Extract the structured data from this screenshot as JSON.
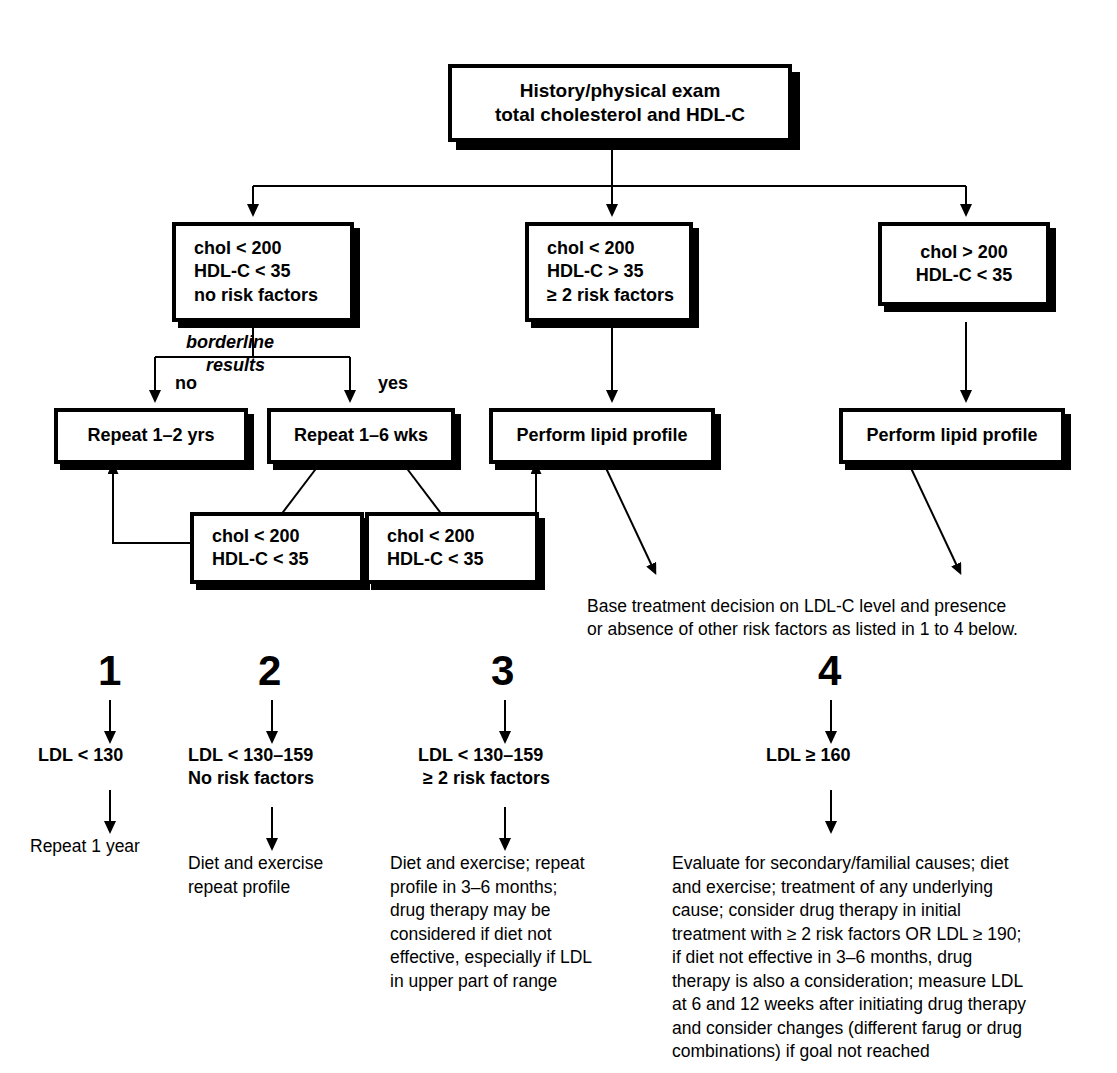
{
  "diagram": {
    "nodes": {
      "root": {
        "line1": "History/physical exam",
        "line2": "total cholesterol and HDL-C"
      },
      "branch_left": {
        "line1": "chol < 200",
        "line2": "HDL-C < 35",
        "line3": "no risk factors"
      },
      "branch_middle": {
        "line1": "chol < 200",
        "line2": "HDL-C > 35",
        "line3": "≥ 2 risk factors"
      },
      "branch_right": {
        "line1": "chol > 200",
        "line2": "HDL-C < 35"
      },
      "repeat_years": {
        "line1": "Repeat 1–2 yrs"
      },
      "repeat_weeks": {
        "line1": "Repeat 1–6 wks"
      },
      "lipid_middle": {
        "line1": "Perform lipid profile"
      },
      "lipid_right": {
        "line1": "Perform lipid profile"
      },
      "recheck_left": {
        "line1": "chol < 200",
        "line2": "HDL-C < 35"
      },
      "recheck_right": {
        "line1": "chol < 200",
        "line2": "HDL-C < 35"
      }
    },
    "edge_labels": {
      "borderline_line1": "borderline",
      "borderline_line2": "results",
      "no": "no",
      "yes": "yes"
    },
    "note": {
      "line1": "Base treatment decision on LDL-C level and presence",
      "line2": "or absence of other risk factors as listed in 1 to 4 below."
    }
  },
  "outcomes": [
    {
      "number": "1",
      "criteria_line1": "LDL < 130",
      "criteria_line2": "",
      "action": "Repeat 1 year"
    },
    {
      "number": "2",
      "criteria_line1": "LDL < 130–159",
      "criteria_line2": "No risk factors",
      "action": "Diet and exercise\nrepeat profile"
    },
    {
      "number": "3",
      "criteria_line1": "LDL < 130–159",
      "criteria_line2": "≥ 2 risk factors",
      "action": "Diet and exercise; repeat\nprofile in 3–6 months;\ndrug therapy may be\nconsidered if diet not\neffective, especially if LDL\nin upper part of range"
    },
    {
      "number": "4",
      "criteria_line1": "LDL ≥ 160",
      "criteria_line2": "",
      "action": "Evaluate for secondary/familial causes; diet\nand exercise; treatment of any underlying\ncause; consider drug therapy in initial\ntreatment with ≥ 2 risk factors OR LDL ≥ 190;\nif diet not effective in 3–6 months, drug\ntherapy is also a consideration; measure LDL\nat 6 and 12 weeks after initiating drug therapy\nand consider changes (different farug or drug\ncombinations) if goal not reached"
    }
  ],
  "colors": {
    "ink": "#000000",
    "paper": "#ffffff"
  }
}
